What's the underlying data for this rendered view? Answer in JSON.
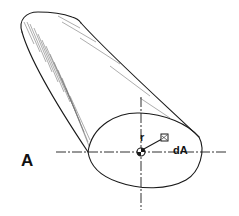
{
  "figure": {
    "panel_label": "A",
    "radius_label": "r",
    "area_element_label": "dA",
    "colors": {
      "line": "#1a1a1a",
      "hatch": "#555555",
      "background": "#ffffff"
    }
  }
}
